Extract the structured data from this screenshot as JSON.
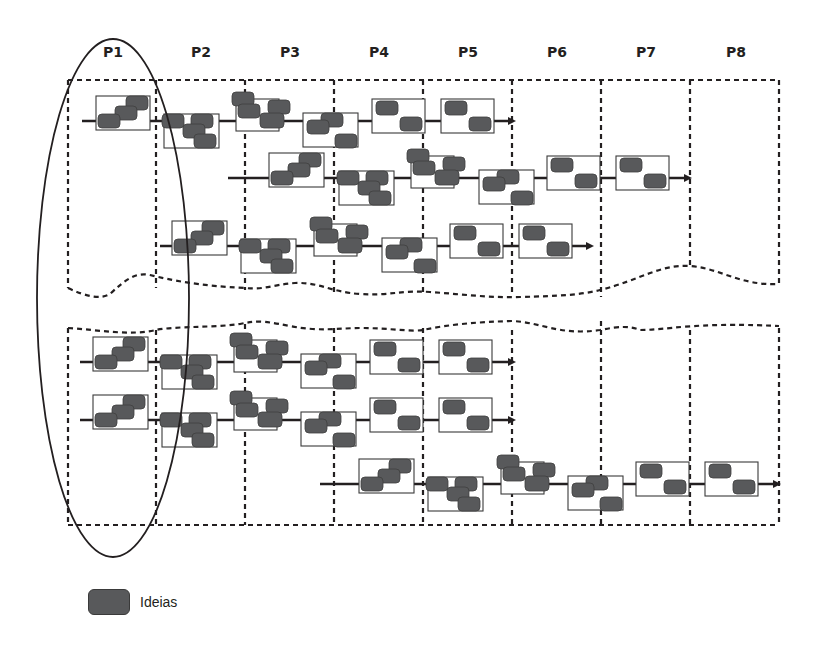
{
  "diagram": {
    "phases": [
      {
        "label": "P1",
        "x": 113
      },
      {
        "label": "P2",
        "x": 201
      },
      {
        "label": "P3",
        "x": 290
      },
      {
        "label": "P4",
        "x": 379
      },
      {
        "label": "P5",
        "x": 468
      },
      {
        "label": "P6",
        "x": 557
      },
      {
        "label": "P7",
        "x": 646
      },
      {
        "label": "P8",
        "x": 736
      }
    ],
    "phase_label_y": 52,
    "column_dividers_x": [
      68,
      156,
      245,
      334,
      423,
      512,
      601,
      690,
      779
    ],
    "colors": {
      "idea_fill": "#58595b",
      "idea_stroke": "#3f3f3f",
      "line": "#231f20",
      "box_stroke": "#3a3a3a",
      "dash": "#231f20"
    },
    "highlight_ellipse": {
      "cx": 113,
      "cy": 298,
      "rx": 76,
      "ry": 259,
      "note": "encircles phase P1"
    },
    "panels": [
      {
        "name": "upper-panel",
        "top": 80,
        "rows": [
          {
            "y": 121,
            "x_start": 82,
            "x_end": 508,
            "arrow": true,
            "blocks": [
              {
                "type": "stair3",
                "x": 96,
                "w": 54
              },
              {
                "type": "grid4",
                "x": 164,
                "w": 55
              },
              {
                "type": "tri3",
                "x": 232,
                "w": 55
              },
              {
                "type": "stair3b",
                "x": 303,
                "w": 55
              },
              {
                "type": "diag2",
                "x": 372,
                "w": 55
              },
              {
                "type": "diag2",
                "x": 441,
                "w": 55
              }
            ]
          },
          {
            "y": 178,
            "x_start": 228,
            "x_end": 684,
            "arrow": true,
            "blocks": [
              {
                "type": "stair3",
                "x": 269,
                "w": 55
              },
              {
                "type": "grid4",
                "x": 339,
                "w": 55
              },
              {
                "type": "tri3",
                "x": 407,
                "w": 55
              },
              {
                "type": "stair3b",
                "x": 479,
                "w": 55
              },
              {
                "type": "diag2",
                "x": 547,
                "w": 55
              },
              {
                "type": "diag2",
                "x": 616,
                "w": 55
              }
            ]
          },
          {
            "y": 246,
            "x_start": 160,
            "x_end": 586,
            "arrow": true,
            "blocks": [
              {
                "type": "stair3",
                "x": 172,
                "w": 55
              },
              {
                "type": "grid4",
                "x": 241,
                "w": 55
              },
              {
                "type": "tri3",
                "x": 310,
                "w": 55
              },
              {
                "type": "stair3b",
                "x": 382,
                "w": 55
              },
              {
                "type": "diag2",
                "x": 450,
                "w": 55
              },
              {
                "type": "diag2",
                "x": 519,
                "w": 55
              }
            ]
          }
        ]
      },
      {
        "name": "lower-panel",
        "top": 330,
        "bottom": 525,
        "rows": [
          {
            "y": 362,
            "x_start": 80,
            "x_end": 508,
            "arrow": true,
            "blocks": [
              {
                "type": "stair3",
                "x": 93,
                "w": 55
              },
              {
                "type": "grid4",
                "x": 162,
                "w": 55
              },
              {
                "type": "tri3",
                "x": 230,
                "w": 55
              },
              {
                "type": "stair3b",
                "x": 301,
                "w": 55
              },
              {
                "type": "diag2",
                "x": 370,
                "w": 55
              },
              {
                "type": "diag2",
                "x": 439,
                "w": 55
              }
            ]
          },
          {
            "y": 420,
            "x_start": 80,
            "x_end": 508,
            "arrow": true,
            "blocks": [
              {
                "type": "stair3",
                "x": 93,
                "w": 55
              },
              {
                "type": "grid4",
                "x": 162,
                "w": 55
              },
              {
                "type": "tri3",
                "x": 230,
                "w": 55
              },
              {
                "type": "stair3b",
                "x": 301,
                "w": 55
              },
              {
                "type": "diag2",
                "x": 370,
                "w": 55
              },
              {
                "type": "diag2",
                "x": 439,
                "w": 55
              }
            ]
          },
          {
            "y": 484,
            "x_start": 320,
            "x_end": 773,
            "arrow": true,
            "blocks": [
              {
                "type": "stair3",
                "x": 359,
                "w": 55
              },
              {
                "type": "grid4",
                "x": 428,
                "w": 55
              },
              {
                "type": "tri3",
                "x": 497,
                "w": 55
              },
              {
                "type": "stair3b",
                "x": 568,
                "w": 55
              },
              {
                "type": "diag2",
                "x": 636,
                "w": 55
              },
              {
                "type": "diag2",
                "x": 705,
                "w": 55
              }
            ]
          }
        ]
      }
    ],
    "legend": {
      "label": "Ideias",
      "icon": "idea-block"
    }
  }
}
